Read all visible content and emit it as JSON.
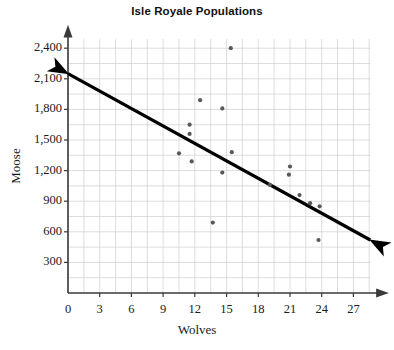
{
  "chart_data": {
    "type": "scatter",
    "title": "Isle Royale Populations",
    "xlabel": "Wolves",
    "ylabel": "Moose",
    "xlim": [
      0,
      29.5
    ],
    "ylim": [
      0,
      2550
    ],
    "xticks": [
      0,
      3,
      6,
      9,
      12,
      15,
      18,
      21,
      24,
      27
    ],
    "xtick_labels": [
      "0",
      "3",
      "6",
      "9",
      "12",
      "15",
      "18",
      "21",
      "24",
      "27"
    ],
    "yticks": [
      300,
      600,
      900,
      1200,
      1500,
      1800,
      2100,
      2400
    ],
    "ytick_labels": [
      "300",
      "600",
      "900",
      "1,200",
      "1,500",
      "1,800",
      "2,100",
      "2,400"
    ],
    "grid": true,
    "grid_color": "#cfcfcf",
    "grid_x_step": 1.5,
    "grid_y_step": 150,
    "axis_color": "#3a3a3a",
    "point_color": "#595959",
    "point_radius": 2.1,
    "points": [
      {
        "x": 15.4,
        "y": 2400
      },
      {
        "x": 12.5,
        "y": 1890
      },
      {
        "x": 14.6,
        "y": 1810
      },
      {
        "x": 11.5,
        "y": 1650
      },
      {
        "x": 11.5,
        "y": 1560
      },
      {
        "x": 15.5,
        "y": 1380
      },
      {
        "x": 10.5,
        "y": 1370
      },
      {
        "x": 11.7,
        "y": 1290
      },
      {
        "x": 21.0,
        "y": 1240
      },
      {
        "x": 14.6,
        "y": 1180
      },
      {
        "x": 20.9,
        "y": 1160
      },
      {
        "x": 19.1,
        "y": 1060
      },
      {
        "x": 21.9,
        "y": 960
      },
      {
        "x": 22.9,
        "y": 880
      },
      {
        "x": 23.8,
        "y": 850
      },
      {
        "x": 13.7,
        "y": 690
      },
      {
        "x": 23.7,
        "y": 520
      }
    ],
    "trend_line": {
      "label": "line of best fit",
      "x_start": 0.0,
      "y_start": 2150,
      "x_end": 28.6,
      "y_end": 520,
      "color": "#000000",
      "width": 3.2,
      "arrow_start": true,
      "arrow_end": true
    }
  }
}
